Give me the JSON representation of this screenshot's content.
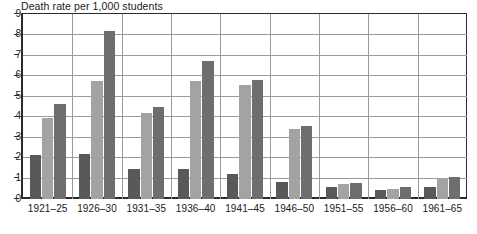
{
  "chart_data": {
    "type": "bar",
    "title": "Death rate per 1,000 students",
    "xlabel": "",
    "ylabel": "",
    "ylim": [
      0,
      9
    ],
    "yticks": [
      0,
      1,
      2,
      3,
      4,
      5,
      6,
      7,
      8,
      9
    ],
    "grid": true,
    "legend": "none",
    "categories": [
      "1921–25",
      "1926–30",
      "1931–35",
      "1936–40",
      "1941–45",
      "1946–50",
      "1951–55",
      "1956–60",
      "1961–65"
    ],
    "series": [
      {
        "name": "series-1",
        "color": "#595959",
        "values": [
          2.15,
          2.2,
          1.45,
          1.45,
          1.2,
          0.85,
          0.6,
          0.45,
          0.6
        ]
      },
      {
        "name": "series-2",
        "color": "#a3a3a3",
        "values": [
          3.95,
          5.75,
          4.2,
          5.75,
          5.55,
          3.4,
          0.75,
          0.5,
          1.0
        ]
      },
      {
        "name": "series-3",
        "color": "#6e6e6e",
        "values": [
          4.6,
          8.15,
          4.5,
          6.7,
          5.8,
          3.55,
          0.8,
          0.6,
          1.05
        ]
      }
    ]
  },
  "colors": {
    "axis": "#2b2b2b",
    "grid": "#9a9a9a",
    "background": "#ffffff",
    "text": "#1a1a1a"
  }
}
